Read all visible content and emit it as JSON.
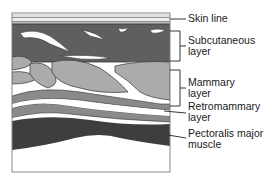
{
  "colors": {
    "frame": "#888888",
    "skin": "#d8d8d8",
    "subcutaneous": "#5f5f5f",
    "mammary": "#ababab",
    "retromammary": "#8a8a8a",
    "pectoralis": "#3e3e3e",
    "fat_white": "#ffffff",
    "outline": "#333333",
    "label_text": "#1a1a1a"
  },
  "labels": [
    {
      "id": "skin",
      "lines": [
        "Skin line"
      ]
    },
    {
      "id": "subcutaneous",
      "lines": [
        "Subcutaneous",
        "layer"
      ]
    },
    {
      "id": "mammary",
      "lines": [
        "Mammary",
        "layer"
      ]
    },
    {
      "id": "retromammary",
      "lines": [
        "Retromammary",
        "layer"
      ]
    },
    {
      "id": "pectoralis",
      "lines": [
        "Pectoralis major",
        "muscle"
      ]
    }
  ]
}
